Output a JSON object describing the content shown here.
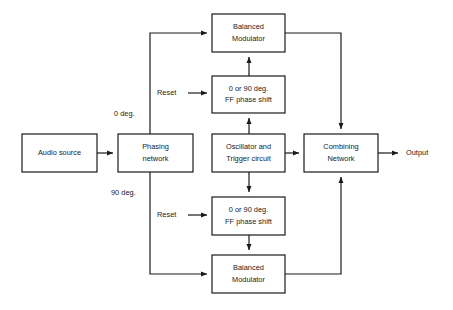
{
  "diagram": {
    "canvas": {
      "width": 453,
      "height": 310
    },
    "style": {
      "line_color": "#1a1a1a",
      "box_fill": "#ffffff",
      "background": "#ffffff",
      "font_size_px": 7.4
    },
    "blocks": [
      {
        "id": "audio-source",
        "x": 22,
        "y": 134,
        "w": 75,
        "h": 38,
        "lines": [
          "Audio source"
        ]
      },
      {
        "id": "phasing-network",
        "x": 118,
        "y": 134,
        "w": 75,
        "h": 38,
        "lines": [
          "Phasing",
          "network"
        ]
      },
      {
        "id": "balanced-modulator-top",
        "x": 212,
        "y": 14,
        "w": 73,
        "h": 38,
        "lines": [
          "Balanced",
          "Modulator"
        ]
      },
      {
        "id": "phase-shift-top",
        "x": 212,
        "y": 76,
        "w": 73,
        "h": 37,
        "lines": [
          "0 or 90 deg.",
          "FF  phase shift"
        ]
      },
      {
        "id": "oscillator-trigger",
        "x": 212,
        "y": 134,
        "w": 73,
        "h": 38,
        "lines": [
          "Oscillator and",
          "Trigger circuit"
        ]
      },
      {
        "id": "phase-shift-bottom",
        "x": 212,
        "y": 197,
        "w": 73,
        "h": 38,
        "lines": [
          "0 or 90 deg.",
          "FF  phase shift"
        ]
      },
      {
        "id": "balanced-modulator-bottom",
        "x": 212,
        "y": 255,
        "w": 73,
        "h": 38,
        "lines": [
          "Balanced",
          "Modulator"
        ]
      },
      {
        "id": "combining-network",
        "x": 304,
        "y": 134,
        "w": 74,
        "h": 38,
        "lines": [
          "Combining",
          "Network"
        ]
      }
    ],
    "edge_labels": [
      {
        "id": "zero-deg",
        "text": "0 deg.",
        "x": 114,
        "y": 114
      },
      {
        "id": "ninety-deg",
        "text": "90 deg.",
        "x": 111,
        "y": 193
      },
      {
        "id": "reset-top",
        "text": "Reset",
        "x": 157,
        "y": 93
      },
      {
        "id": "reset-bottom",
        "text": "Reset",
        "x": 157,
        "y": 215
      },
      {
        "id": "output",
        "text": "Output",
        "x": 406,
        "y": 153
      }
    ],
    "connections": [
      {
        "id": "audio-to-phasing",
        "points": "97,153 113,153",
        "arrow": true
      },
      {
        "id": "phasing-to-modulator-top",
        "points": "150,134 150,33 207,33",
        "arrow": true
      },
      {
        "id": "phasing-to-modulator-bottom",
        "points": "150,172 150,274 207,274",
        "arrow": true
      },
      {
        "id": "reset-arrow-top",
        "points": "188,93 207,93",
        "arrow": true
      },
      {
        "id": "reset-arrow-bottom",
        "points": "188,215 207,215",
        "arrow": true
      },
      {
        "id": "oscillator-to-phase-shift-top",
        "points": "249,134 249,118",
        "arrow": true
      },
      {
        "id": "phase-shift-top-to-modulator-top",
        "points": "249,76 249,57",
        "arrow": true
      },
      {
        "id": "oscillator-to-phase-shift-bottom",
        "points": "249,172 249,192",
        "arrow": true
      },
      {
        "id": "phase-shift-bottom-to-modulator-bottom",
        "points": "249,235 249,250",
        "arrow": true
      },
      {
        "id": "oscillator-to-combining",
        "points": "285,153 299,153",
        "arrow": true
      },
      {
        "id": "modulator-top-to-combining",
        "points": "285,33 341,33 341,129",
        "arrow": true
      },
      {
        "id": "modulator-bottom-to-combining",
        "points": "285,274 341,274 341,177",
        "arrow": true
      },
      {
        "id": "combining-to-output",
        "points": "378,153 398,153",
        "arrow": true
      }
    ]
  }
}
